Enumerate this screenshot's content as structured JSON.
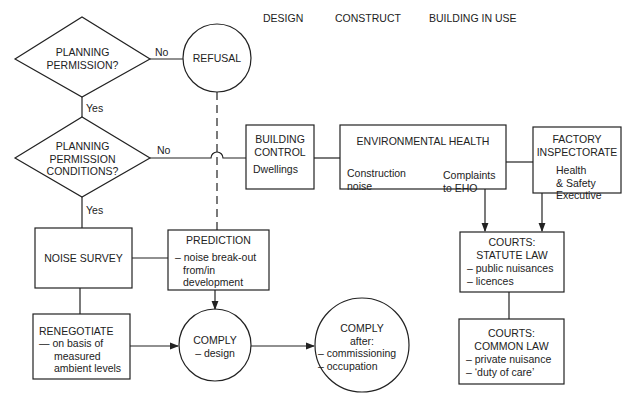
{
  "phases": [
    "DESIGN",
    "CONSTRUCT",
    "BUILDING IN USE"
  ],
  "nodes": {
    "planning_permission": {
      "shape": "diamond",
      "lines": [
        "PLANNING",
        "PERMISSION?"
      ]
    },
    "refusal": {
      "shape": "circle",
      "label": "REFUSAL"
    },
    "planning_conditions": {
      "shape": "diamond",
      "lines": [
        "PLANNING",
        "PERMISSION",
        "CONDITIONS?"
      ]
    },
    "building_control": {
      "shape": "box",
      "title": [
        "BUILDING",
        "CONTROL"
      ],
      "body": "Dwellings"
    },
    "environmental_health": {
      "shape": "box",
      "title": "ENVIRONMENTAL HEALTH",
      "left": [
        "Construction",
        "noise"
      ],
      "right": [
        "Complaints",
        "to EHO"
      ]
    },
    "factory_inspectorate": {
      "shape": "box",
      "title": [
        "FACTORY",
        "INSPECTORATE"
      ],
      "body": [
        "Health",
        "& Safety",
        "Executive"
      ]
    },
    "noise_survey": {
      "shape": "box",
      "label": "NOISE SURVEY"
    },
    "prediction": {
      "shape": "box",
      "title": "PREDICTION",
      "body": [
        "– noise break-out",
        "from/in",
        "development"
      ]
    },
    "courts_statute": {
      "shape": "box",
      "title": [
        "COURTS:",
        "STATUTE LAW"
      ],
      "body": [
        "– public nuisances",
        "– licences"
      ]
    },
    "renegotiate": {
      "shape": "box",
      "title": "RENEGOTIATE",
      "body": [
        "— on basis of",
        "measured",
        "ambient levels"
      ]
    },
    "comply_design": {
      "shape": "circle",
      "title": "COMPLY",
      "body": "– design"
    },
    "comply_after": {
      "shape": "circle",
      "title": "COMPLY",
      "body": [
        "after:",
        "– commissioning",
        "– occupation"
      ]
    },
    "courts_common": {
      "shape": "box",
      "title": [
        "COURTS:",
        "COMMON LAW"
      ],
      "body": [
        "– private nuisance",
        "– ‘duty of care’"
      ]
    }
  },
  "edges": {
    "no_1": "No",
    "yes_1": "Yes",
    "no_2": "No",
    "yes_2": "Yes"
  }
}
